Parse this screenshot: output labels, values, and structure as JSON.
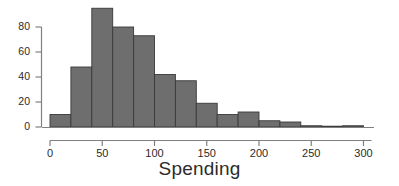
{
  "chart_data": {
    "type": "bar",
    "title": "",
    "subtitle": "",
    "xlabel": "Spending",
    "ylabel": "",
    "grid": false,
    "legend": null,
    "xlim": [
      0,
      310
    ],
    "ylim": [
      0,
      98
    ],
    "xticks": [
      0,
      50,
      100,
      150,
      200,
      250,
      300
    ],
    "xtick_labels": [
      "0",
      "50",
      "100",
      "150",
      "200",
      "250",
      "300"
    ],
    "yticks": [
      0,
      20,
      40,
      60,
      80
    ],
    "ytick_labels": [
      "0",
      "20",
      "40",
      "60",
      "80"
    ],
    "bin_width": 20,
    "bin_edges": [
      0,
      20,
      40,
      60,
      80,
      100,
      120,
      140,
      160,
      180,
      200,
      220,
      240,
      260,
      280,
      300
    ],
    "categories": [
      "0-20",
      "20-40",
      "40-60",
      "60-80",
      "80-100",
      "100-120",
      "120-140",
      "140-160",
      "160-180",
      "180-200",
      "200-220",
      "220-240",
      "240-260",
      "260-280",
      "280-300"
    ],
    "values": [
      10,
      48,
      95,
      80,
      73,
      42,
      37,
      19,
      10,
      12,
      5,
      4,
      1,
      0,
      1
    ],
    "bar_fill_color": "#6e6e6e",
    "bar_border_color": "#3a3a3a",
    "axis_color": "#808080",
    "text_color": "#2b2b2b"
  }
}
